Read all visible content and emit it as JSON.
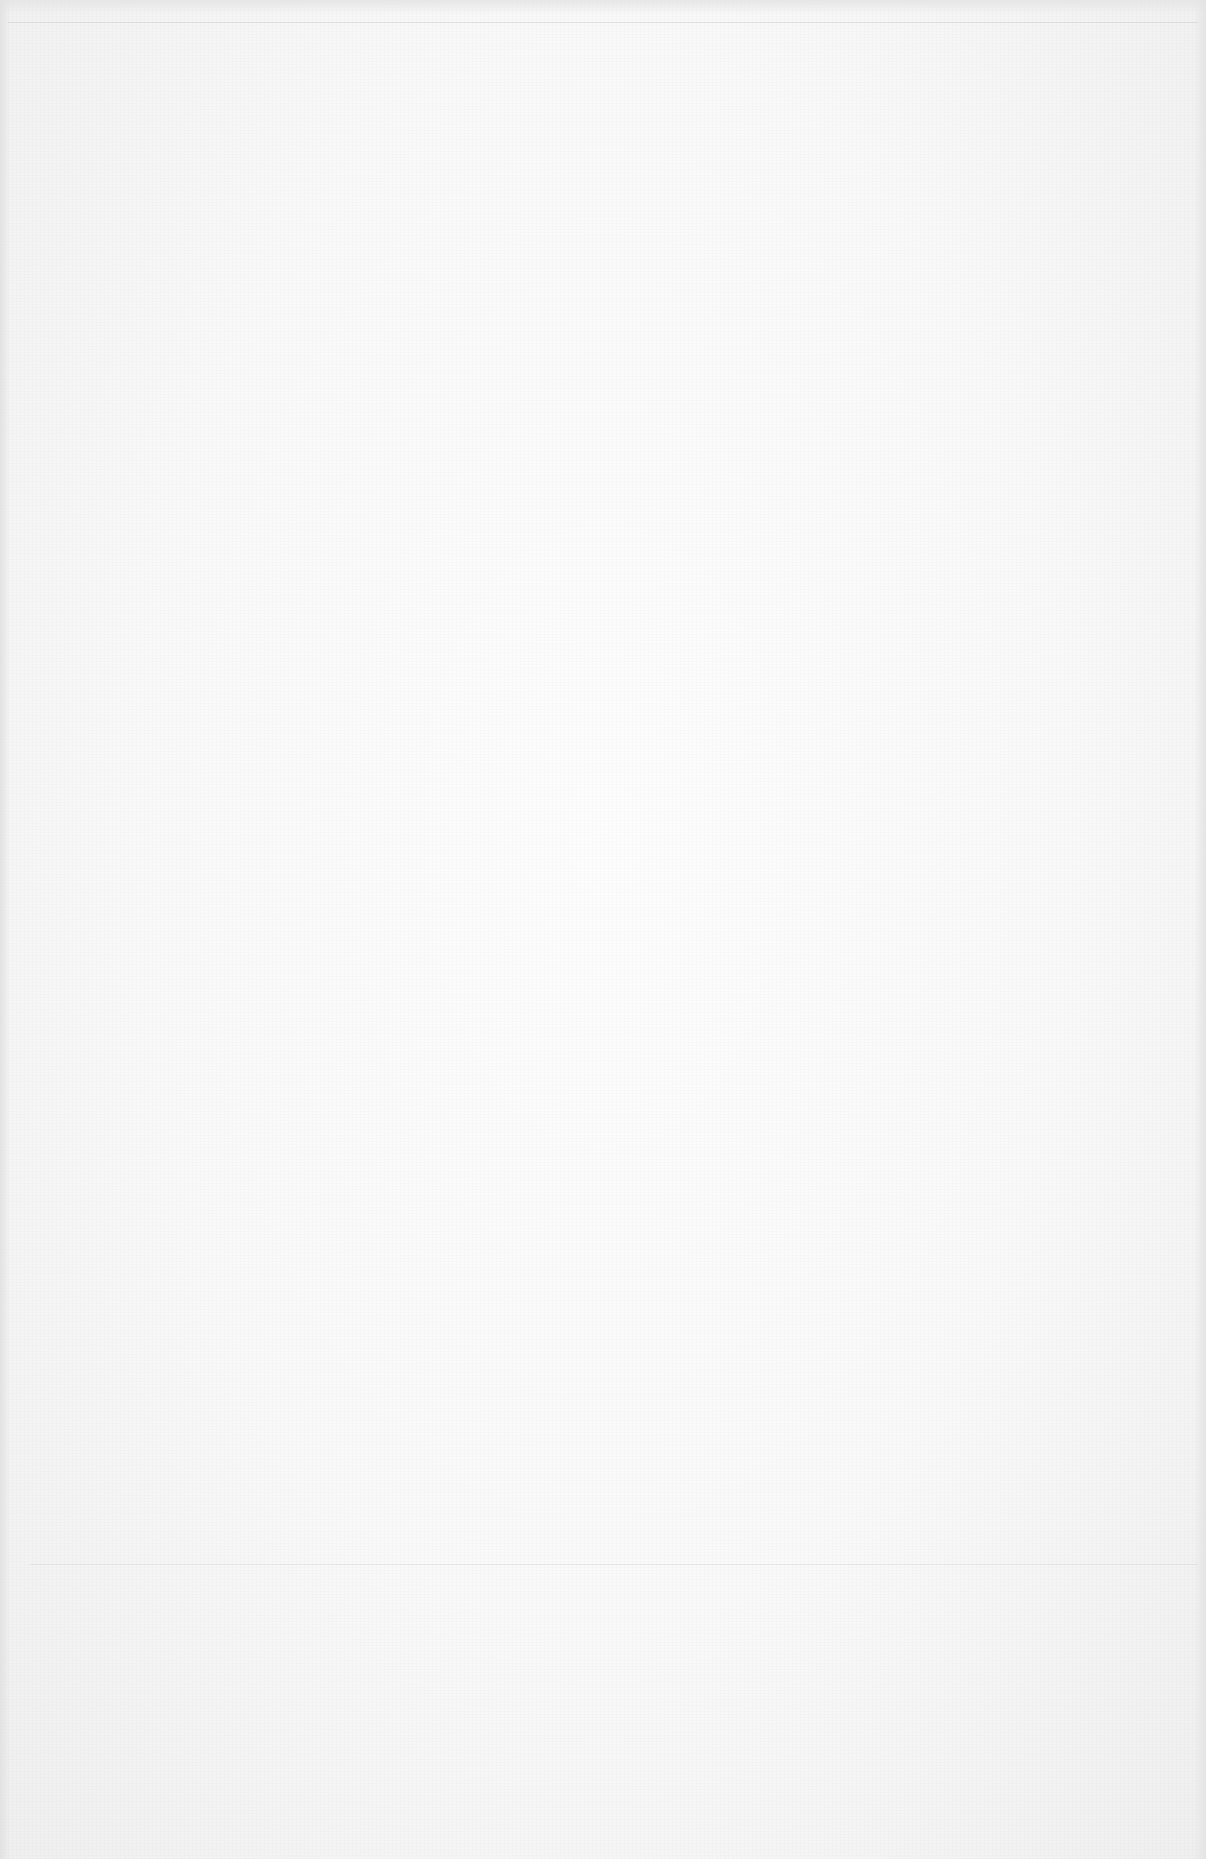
{
  "document": {
    "type": "blank scanned page",
    "text": "",
    "colors": {
      "paper": "#f9f9f9",
      "rule": "#d6d6d6",
      "edge_shadow": "#e2e2e2"
    }
  }
}
